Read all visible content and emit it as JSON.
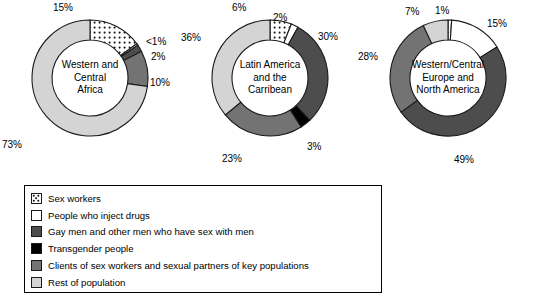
{
  "chart_data": {
    "type": "pie",
    "title": "",
    "subtitle": "",
    "legend_position": "bottom",
    "categories": [
      "Sex workers",
      "People who inject drugs",
      "Gay men and other men who have sex with men",
      "Transgender people",
      "Clients of sex workers and sexual partners of key populations",
      "Rest of population"
    ],
    "series": [
      {
        "name": "Western and Central Africa",
        "values": [
          15,
          0.5,
          2,
          0,
          10,
          73
        ],
        "labels": [
          "15%",
          "<1%",
          "2%",
          "",
          "10%",
          "73%"
        ]
      },
      {
        "name": "Latin America and the Carribean",
        "values": [
          6,
          2,
          30,
          3,
          23,
          36
        ],
        "labels": [
          "6%",
          "2%",
          "30%",
          "3%",
          "23%",
          "36%"
        ]
      },
      {
        "name": "Western/Central Europe and North America",
        "values": [
          1,
          15,
          49,
          0,
          28,
          7
        ],
        "labels": [
          "1%",
          "15%",
          "49%",
          "",
          "28%",
          "7%"
        ]
      }
    ]
  },
  "donuts": [
    {
      "title_lines": [
        "Western and",
        "Central",
        "Africa"
      ],
      "labels": [
        {
          "text": "15%",
          "x": 53,
          "y": 3
        },
        {
          "text": "<1%",
          "x": 146,
          "y": 37
        },
        {
          "text": "2%",
          "x": 151,
          "y": 52
        },
        {
          "text": "10%",
          "x": 150,
          "y": 78
        },
        {
          "text": "73%",
          "x": 2,
          "y": 140
        }
      ]
    },
    {
      "title_lines": [
        "Latin America",
        "and the",
        "Carribean"
      ],
      "labels": [
        {
          "text": "6%",
          "x": 52,
          "y": 3
        },
        {
          "text": "2%",
          "x": 93,
          "y": 13
        },
        {
          "text": "30%",
          "x": 138,
          "y": 32
        },
        {
          "text": "3%",
          "x": 127,
          "y": 142
        },
        {
          "text": "23%",
          "x": 42,
          "y": 154
        },
        {
          "text": "36%",
          "x": 1,
          "y": 33
        }
      ]
    },
    {
      "title_lines": [
        "Western/Central",
        "Europe and",
        "North America"
      ],
      "labels": [
        {
          "text": "7%",
          "x": 47,
          "y": 7
        },
        {
          "text": "1%",
          "x": 77,
          "y": 6
        },
        {
          "text": "15%",
          "x": 129,
          "y": 19
        },
        {
          "text": "49%",
          "x": 96,
          "y": 155
        },
        {
          "text": "28%",
          "x": 0,
          "y": 52
        }
      ]
    }
  ],
  "legend": {
    "items": [
      {
        "label": "Sex workers",
        "swatch": "dotted-pattern-swatch",
        "fill": "#ffffff"
      },
      {
        "label": "People who inject drugs",
        "swatch": "white-swatch",
        "fill": "#ffffff"
      },
      {
        "label": "Gay men and other men who have sex with men",
        "swatch": "dark-gray-swatch",
        "fill": "#4d4d4d"
      },
      {
        "label": "Transgender people",
        "swatch": "black-swatch",
        "fill": "#000000"
      },
      {
        "label": "Clients of sex workers and sexual partners of key populations",
        "swatch": "mid-gray-swatch",
        "fill": "#737373"
      },
      {
        "label": "Rest of population",
        "swatch": "light-gray-swatch",
        "fill": "#d4d4d4"
      }
    ]
  },
  "colors": {
    "sex_workers": "#ffffff",
    "inject_drugs": "#ffffff",
    "gay_men": "#4d4d4d",
    "transgender": "#000000",
    "clients": "#737373",
    "rest": "#d4d4d4",
    "stroke": "#1a1a1a"
  }
}
